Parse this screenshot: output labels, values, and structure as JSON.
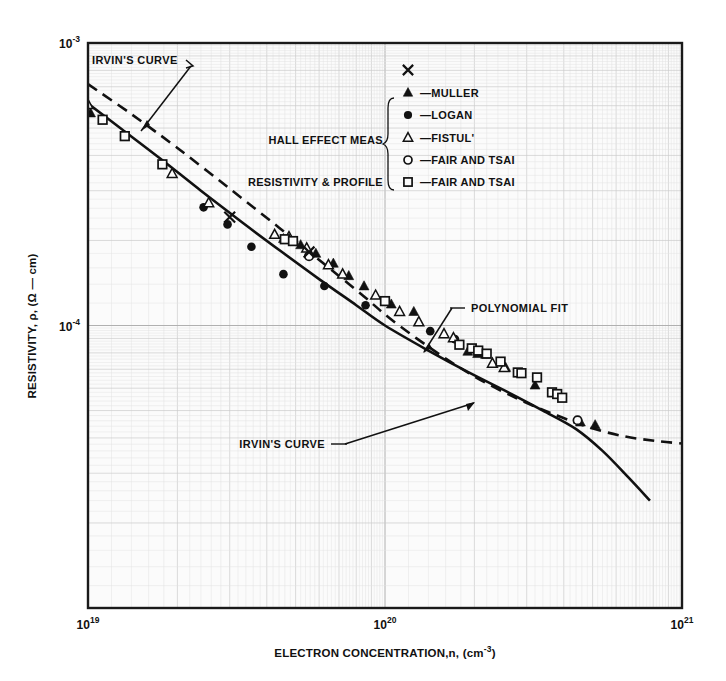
{
  "figure": {
    "background": "#ffffff",
    "plot_background": "#fbfbfb",
    "grid_color": "#c9c9c9",
    "grid_minor_color": "#e0e0e0",
    "axis_color": "#1a1a1a",
    "ink_color": "#111111"
  },
  "axes": {
    "x": {
      "label_prefix": "ELECTRON CONCENTRATION,n, (cm",
      "label_exp": "-3",
      "label_suffix": ")",
      "ticks": [
        {
          "mantissa": "10",
          "exponent": "19"
        },
        {
          "mantissa": "10",
          "exponent": "20"
        },
        {
          "mantissa": "10",
          "exponent": "21"
        }
      ],
      "min": 1e+19,
      "max": 1e+21,
      "scale": "log"
    },
    "y": {
      "label": "RESISTIVITY, ρ, (Ω — cm)",
      "ticks": [
        {
          "mantissa": "10",
          "exponent": "-2"
        },
        {
          "mantissa": "10",
          "exponent": "-3"
        },
        {
          "mantissa": "10",
          "exponent": "-4"
        }
      ],
      "min": 0.0001,
      "max": 0.01,
      "scale": "log"
    }
  },
  "annotations": [
    {
      "id": "irvin-top",
      "text": "IRVIN'S CURVE"
    },
    {
      "id": "polynomial-fit",
      "text": "POLYNOMIAL FIT"
    },
    {
      "id": "irvin-bottom",
      "text": "IRVIN'S CURVE"
    }
  ],
  "legend": {
    "group_hall": "HALL EFFECT MEAS",
    "group_resistivity": "RESISTIVITY & PROFILE",
    "entries": [
      {
        "marker": "cross",
        "label": ""
      },
      {
        "marker": "filled-triangle",
        "label": "—MULLER"
      },
      {
        "marker": "filled-circle",
        "label": "—LOGAN"
      },
      {
        "marker": "open-triangle",
        "label": "—FISTUL'"
      },
      {
        "marker": "open-circle",
        "label": "—FAIR AND TSAI"
      },
      {
        "marker": "open-square",
        "label": "—FAIR AND TSAI"
      }
    ]
  },
  "chart_data": {
    "type": "scatter",
    "title": "",
    "xlabel": "ELECTRON CONCENTRATION,n, (cm-3)",
    "ylabel": "RESISTIVITY, rho, (Ohm - cm)",
    "xscale": "log",
    "yscale": "log",
    "xlim": [
      1e+19,
      1e+21
    ],
    "ylim": [
      0.0001,
      0.01
    ],
    "grid": true,
    "legend_position": "upper-right-inside",
    "series": [
      {
        "name": "MULLER",
        "marker": "filled-triangle",
        "points": [
          [
            1.02e+19,
            0.00565
          ],
          [
            4.55e+19,
            0.00203
          ],
          [
            5.2e+19,
            0.00193
          ],
          [
            5.85e+19,
            0.0018
          ],
          [
            6.7e+19,
            0.00166
          ],
          [
            7.55e+19,
            0.0015
          ],
          [
            8.5e+19,
            0.00138
          ],
          [
            1.05e+20,
            0.00119
          ],
          [
            1.25e+20,
            0.00112
          ],
          [
            1.9e+20,
            0.00081
          ],
          [
            2.05e+20,
            0.000795
          ],
          [
            2.18e+20,
            0.00079
          ],
          [
            2.55e+20,
            0.00071
          ],
          [
            3.2e+20,
            0.000615
          ],
          [
            4.55e+20,
            0.000455
          ],
          [
            5.1e+20,
            0.000445
          ]
        ]
      },
      {
        "name": "LOGAN",
        "marker": "filled-circle",
        "points": [
          [
            2.45e+19,
            0.00262
          ],
          [
            2.95e+19,
            0.00228
          ],
          [
            3.55e+19,
            0.0019
          ],
          [
            4.55e+19,
            0.00152
          ],
          [
            6.25e+19,
            0.00138
          ],
          [
            8.6e+19,
            0.00118
          ],
          [
            1.42e+20,
            0.000955
          ],
          [
            1.72e+20,
            0.000895
          ]
        ]
      },
      {
        "name": "FISTUL'",
        "marker": "open-triangle",
        "points": [
          [
            1e+19,
            0.00605
          ],
          [
            1.92e+19,
            0.00345
          ],
          [
            2.55e+19,
            0.00272
          ],
          [
            4.25e+19,
            0.0021
          ],
          [
            4.75e+19,
            0.00206
          ],
          [
            5.45e+19,
            0.00188
          ],
          [
            6.45e+19,
            0.00164
          ],
          [
            7.2e+19,
            0.00152
          ],
          [
            9.3e+19,
            0.00128
          ],
          [
            1.12e+20,
            0.00112
          ],
          [
            1.3e+20,
            0.00103
          ],
          [
            1.58e+20,
            0.000935
          ],
          [
            1.7e+20,
            0.000905
          ],
          [
            2.3e+20,
            0.000735
          ],
          [
            2.52e+20,
            0.00071
          ]
        ]
      },
      {
        "name": "FAIR AND TSAI (Hall)",
        "marker": "open-circle",
        "points": [
          [
            5.55e+19,
            0.00176
          ],
          [
            4.45e+20,
            0.000462
          ]
        ]
      },
      {
        "name": "FAIR AND TSAI (Resistivity & Profile)",
        "marker": "open-square",
        "points": [
          [
            1.12e+19,
            0.00535
          ],
          [
            1.33e+19,
            0.00468
          ],
          [
            1.78e+19,
            0.00372
          ],
          [
            4.6e+19,
            0.00202
          ],
          [
            4.9e+19,
            0.00199
          ],
          [
            1e+20,
            0.00122
          ],
          [
            1.78e+20,
            0.000855
          ],
          [
            1.96e+20,
            0.00083
          ],
          [
            2.06e+20,
            0.000815
          ],
          [
            2.2e+20,
            0.000795
          ],
          [
            2.45e+20,
            0.000745
          ],
          [
            2.8e+20,
            0.000682
          ],
          [
            2.88e+20,
            0.000678
          ],
          [
            3.25e+20,
            0.000655
          ],
          [
            3.65e+20,
            0.00058
          ],
          [
            3.8e+20,
            0.000572
          ],
          [
            3.95e+20,
            0.000555
          ]
        ]
      },
      {
        "name": "Cross (unlabeled)",
        "marker": "cross",
        "points": [
          [
            3e+19,
            0.00242
          ],
          [
            5.55e+19,
            0.00182
          ]
        ]
      }
    ],
    "curves": [
      {
        "name": "POLYNOMIAL FIT",
        "style": "solid",
        "points": [
          [
            1e+19,
            0.0061
          ],
          [
            1.3e+19,
            0.00495
          ],
          [
            1.75e+19,
            0.0039
          ],
          [
            2.4e+19,
            0.003
          ],
          [
            3.3e+19,
            0.00232
          ],
          [
            4.5e+19,
            0.00182
          ],
          [
            6e+19,
            0.00146
          ],
          [
            8e+19,
            0.00118
          ],
          [
            1e+20,
            0.001
          ],
          [
            1.4e+20,
            0.000815
          ],
          [
            1.9e+20,
            0.000685
          ],
          [
            2.6e+20,
            0.00058
          ],
          [
            3.4e+20,
            0.0005
          ],
          [
            4.4e+20,
            0.00043
          ],
          [
            5.4e+20,
            0.00036
          ],
          [
            6.6e+20,
            0.00029
          ],
          [
            7.8e+20,
            0.00024
          ]
        ]
      },
      {
        "name": "IRVIN'S CURVE",
        "style": "dashed",
        "points": [
          [
            1e+19,
            0.00715
          ],
          [
            1.4e+19,
            0.0056
          ],
          [
            2e+19,
            0.00425
          ],
          [
            3e+19,
            0.00305
          ],
          [
            4.4e+19,
            0.00222
          ],
          [
            6.2e+19,
            0.00166
          ],
          [
            8.4e+19,
            0.00128
          ],
          [
            1.05e+20,
            0.00105
          ],
          [
            1.45e+20,
            0.00082
          ],
          [
            2e+20,
            0.00066
          ],
          [
            2.8e+20,
            0.00055
          ],
          [
            3.8e+20,
            0.00048
          ],
          [
            4.9e+20,
            0.000435
          ],
          [
            6.4e+20,
            0.000405
          ],
          [
            8.2e+20,
            0.00039
          ],
          [
            1e+21,
            0.000382
          ]
        ]
      }
    ]
  }
}
